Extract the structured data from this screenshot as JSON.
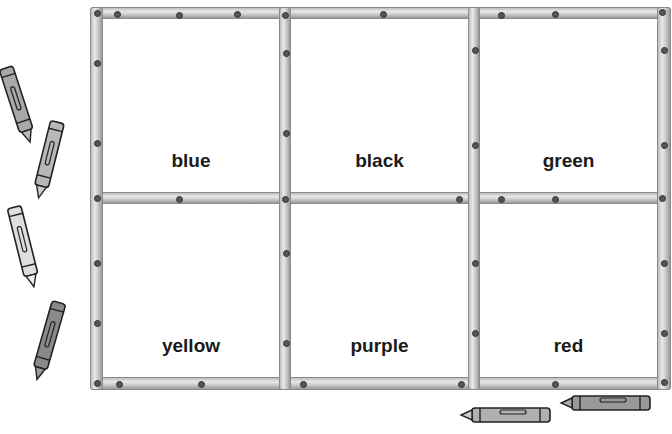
{
  "grid": {
    "cells": [
      {
        "label": "blue"
      },
      {
        "label": "black"
      },
      {
        "label": "green"
      },
      {
        "label": "yellow"
      },
      {
        "label": "purple"
      },
      {
        "label": "red"
      }
    ]
  },
  "crayons": [
    {
      "name": "crayon-1",
      "shade": "#a8a8a8"
    },
    {
      "name": "crayon-2",
      "shade": "#b8b8b8"
    },
    {
      "name": "crayon-3",
      "shade": "#dedede"
    },
    {
      "name": "crayon-4",
      "shade": "#8a8a8a"
    },
    {
      "name": "crayon-5",
      "shade": "#b0b0b0"
    },
    {
      "name": "crayon-6",
      "shade": "#999999"
    }
  ],
  "colors": {
    "frame": "#cfcfcf",
    "label": "#1a1a1a",
    "background": "#ffffff"
  }
}
